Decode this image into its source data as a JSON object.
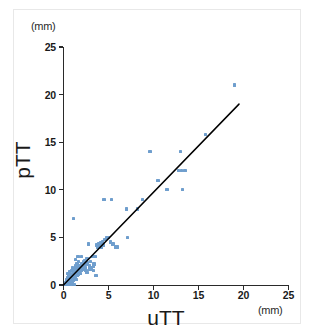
{
  "chart_data": {
    "type": "scatter",
    "title": "",
    "xlabel": "uTT",
    "ylabel": "pTT",
    "x_unit": "(mm)",
    "y_unit": "(mm)",
    "xlim": [
      0,
      25
    ],
    "ylim": [
      0,
      25
    ],
    "xticks": [
      0,
      5,
      10,
      15,
      20,
      25
    ],
    "yticks": [
      0,
      5,
      10,
      15,
      20,
      25
    ],
    "xtick_labels": [
      "0",
      "5",
      "10",
      "15",
      "20",
      "25"
    ],
    "ytick_labels": [
      "0",
      "5",
      "10",
      "15",
      "20",
      "25"
    ],
    "grid": false,
    "legend": null,
    "point_color": "#6f9ecd",
    "line_color": "#000000",
    "fit_line": {
      "name": "regression line",
      "x0": 0.0,
      "y0": 0.0,
      "x1": 19.5,
      "y1": 19.0
    },
    "series": [
      {
        "name": "pTT vs uTT",
        "points": [
          [
            0.2,
            0.2
          ],
          [
            0.3,
            0.1
          ],
          [
            0.3,
            0.4
          ],
          [
            0.4,
            0.2
          ],
          [
            0.4,
            0.6
          ],
          [
            0.5,
            0.3
          ],
          [
            0.5,
            0.8
          ],
          [
            0.5,
            1.2
          ],
          [
            0.6,
            0.2
          ],
          [
            0.6,
            0.5
          ],
          [
            0.6,
            1.0
          ],
          [
            0.7,
            0.3
          ],
          [
            0.7,
            0.7
          ],
          [
            0.7,
            1.4
          ],
          [
            0.8,
            0.2
          ],
          [
            0.8,
            0.6
          ],
          [
            0.8,
            1.1
          ],
          [
            0.9,
            0.4
          ],
          [
            0.9,
            0.9
          ],
          [
            0.9,
            1.5
          ],
          [
            1.0,
            0.3
          ],
          [
            1.0,
            0.8
          ],
          [
            1.0,
            1.2
          ],
          [
            1.0,
            1.8
          ],
          [
            1.1,
            0.5
          ],
          [
            1.1,
            1.0
          ],
          [
            1.1,
            1.4
          ],
          [
            1.2,
            0.7
          ],
          [
            1.2,
            1.1
          ],
          [
            1.2,
            1.6
          ],
          [
            1.3,
            0.9
          ],
          [
            1.3,
            1.3
          ],
          [
            1.3,
            2.0
          ],
          [
            1.4,
            0.6
          ],
          [
            1.4,
            1.2
          ],
          [
            1.4,
            1.7
          ],
          [
            1.5,
            1.0
          ],
          [
            1.5,
            1.5
          ],
          [
            1.5,
            2.2
          ],
          [
            1.6,
            1.3
          ],
          [
            1.6,
            1.8
          ],
          [
            1.7,
            1.1
          ],
          [
            1.7,
            1.6
          ],
          [
            1.7,
            2.5
          ],
          [
            1.8,
            1.4
          ],
          [
            1.8,
            2.0
          ],
          [
            1.9,
            1.2
          ],
          [
            1.9,
            1.7
          ],
          [
            2.0,
            1.5
          ],
          [
            2.0,
            2.2
          ],
          [
            2.0,
            3.0
          ],
          [
            2.1,
            1.9
          ],
          [
            2.2,
            1.6
          ],
          [
            2.2,
            2.4
          ],
          [
            2.3,
            2.0
          ],
          [
            2.4,
            1.8
          ],
          [
            2.4,
            2.6
          ],
          [
            2.5,
            2.2
          ],
          [
            2.5,
            1.5
          ],
          [
            2.6,
            2.8
          ],
          [
            2.7,
            2.3
          ],
          [
            2.8,
            4.3
          ],
          [
            2.9,
            2.0
          ],
          [
            3.0,
            2.5
          ],
          [
            3.0,
            1.6
          ],
          [
            3.1,
            1.8
          ],
          [
            3.2,
            3.0
          ],
          [
            3.3,
            1.5
          ],
          [
            3.4,
            2.2
          ],
          [
            3.5,
            3.0
          ],
          [
            3.6,
            1.0
          ],
          [
            3.7,
            4.2
          ],
          [
            3.8,
            4.0
          ],
          [
            3.9,
            4.3
          ],
          [
            4.0,
            4.1
          ],
          [
            4.1,
            4.4
          ],
          [
            4.2,
            4.0
          ],
          [
            4.3,
            4.5
          ],
          [
            4.4,
            4.2
          ],
          [
            4.5,
            9.0
          ],
          [
            4.6,
            4.8
          ],
          [
            4.8,
            5.0
          ],
          [
            5.0,
            5.0
          ],
          [
            5.2,
            4.5
          ],
          [
            5.3,
            9.0
          ],
          [
            5.5,
            4.3
          ],
          [
            5.8,
            4.0
          ],
          [
            6.0,
            4.0
          ],
          [
            7.0,
            8.0
          ],
          [
            7.1,
            5.0
          ],
          [
            8.2,
            8.0
          ],
          [
            8.8,
            9.0
          ],
          [
            9.6,
            14.0
          ],
          [
            10.5,
            11.0
          ],
          [
            11.5,
            10.0
          ],
          [
            12.8,
            12.0
          ],
          [
            13.0,
            14.0
          ],
          [
            13.1,
            12.0
          ],
          [
            13.2,
            10.0
          ],
          [
            13.5,
            12.0
          ],
          [
            15.8,
            15.8
          ],
          [
            19.0,
            21.0
          ],
          [
            1.1,
            7.0
          ],
          [
            1.6,
            3.0
          ],
          [
            1.3,
            2.7
          ],
          [
            2.9,
            1.7
          ],
          [
            3.3,
            2.0
          ],
          [
            2.6,
            1.3
          ],
          [
            0.2,
            0.05
          ],
          [
            0.35,
            0.05
          ],
          [
            0.5,
            0.05
          ],
          [
            0.7,
            0.05
          ],
          [
            0.9,
            0.05
          ],
          [
            1.2,
            0.05
          ]
        ]
      }
    ]
  },
  "axes": {
    "y_unit_label": "(mm)",
    "x_unit_label": "(mm)",
    "y_title": "pTT",
    "x_title": "uTT"
  }
}
